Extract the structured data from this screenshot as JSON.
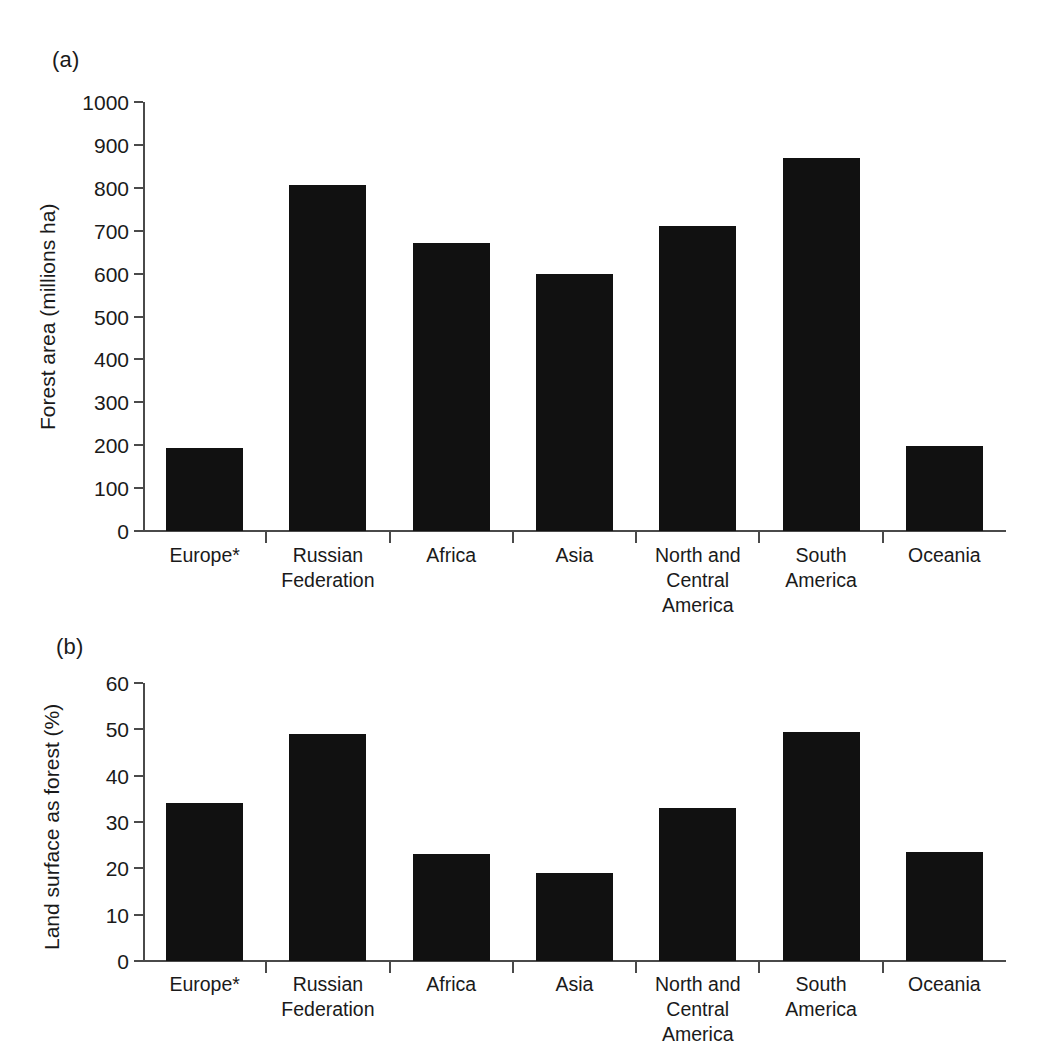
{
  "figure": {
    "background": "#ffffff",
    "ink_color": "#111111",
    "axis_color": "#4a4a4a"
  },
  "panels": {
    "a": {
      "tag": "(a)"
    },
    "b": {
      "tag": "(b)"
    }
  },
  "chart_data": [
    {
      "panel": "(a)",
      "type": "bar",
      "title": "",
      "xlabel": "",
      "ylabel": "Forest area (millions ha)",
      "ylim": [
        0,
        1000
      ],
      "yticks": [
        0,
        100,
        200,
        300,
        400,
        500,
        600,
        700,
        800,
        900,
        1000
      ],
      "ytick_labels": [
        "0",
        "100",
        "200",
        "300",
        "400",
        "500",
        "600",
        "700",
        "800",
        "900",
        "1000"
      ],
      "grid": false,
      "legend": null,
      "categories": [
        "Europe*",
        "Russian\nFederation",
        "Africa",
        "Asia",
        "North and\nCentral\nAmerica",
        "South\nAmerica",
        "Oceania"
      ],
      "values": [
        194,
        807,
        671,
        599,
        711,
        869,
        198
      ],
      "bar_color": "#111111"
    },
    {
      "panel": "(b)",
      "type": "bar",
      "title": "",
      "xlabel": "",
      "ylabel": "Land surface as forest (%)",
      "ylim": [
        0,
        60
      ],
      "yticks": [
        0,
        10,
        20,
        30,
        40,
        50,
        60
      ],
      "ytick_labels": [
        "0",
        "10",
        "20",
        "30",
        "40",
        "50",
        "60"
      ],
      "grid": false,
      "legend": null,
      "categories": [
        "Europe*",
        "Russian\nFederation",
        "Africa",
        "Asia",
        "North and\nCentral\nAmerica",
        "South\nAmerica",
        "Oceania"
      ],
      "values": [
        34,
        49,
        23,
        19,
        33,
        49.5,
        23.5
      ],
      "bar_color": "#111111"
    }
  ]
}
